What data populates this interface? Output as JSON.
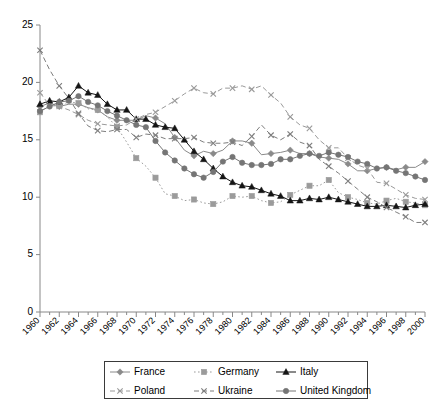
{
  "chart_data": {
    "type": "line",
    "title": "",
    "xlabel": "",
    "ylabel": "",
    "xlim": [
      1960,
      2000
    ],
    "ylim": [
      0,
      25
    ],
    "ytick_step": 5,
    "yticks": [
      0,
      5,
      10,
      15,
      20,
      25
    ],
    "xticks": [
      1960,
      1962,
      1964,
      1966,
      1968,
      1970,
      1972,
      1974,
      1976,
      1978,
      1980,
      1982,
      1984,
      1986,
      1988,
      1990,
      1992,
      1994,
      1996,
      1998,
      2000
    ],
    "xtick_minor_step": 1,
    "grid": false,
    "legend_position": "bottom",
    "x": [
      1960,
      1961,
      1962,
      1963,
      1964,
      1965,
      1966,
      1967,
      1968,
      1969,
      1970,
      1971,
      1972,
      1973,
      1974,
      1975,
      1976,
      1977,
      1978,
      1979,
      1980,
      1981,
      1982,
      1983,
      1984,
      1985,
      1986,
      1987,
      1988,
      1989,
      1990,
      1991,
      1992,
      1993,
      1994,
      1995,
      1996,
      1997,
      1998,
      1999,
      2000
    ],
    "series": [
      {
        "name": "France",
        "color": "#8a8a8a",
        "marker": "diamond",
        "dash": "solid",
        "values": [
          17.9,
          18.2,
          17.9,
          18.1,
          18.1,
          17.8,
          17.6,
          17.0,
          16.7,
          16.7,
          16.7,
          17.1,
          16.9,
          16.4,
          15.2,
          14.1,
          13.6,
          14.0,
          13.8,
          14.1,
          14.9,
          14.9,
          14.7,
          13.7,
          13.8,
          13.9,
          14.1,
          13.8,
          13.8,
          13.5,
          13.4,
          13.3,
          12.9,
          12.3,
          12.3,
          12.5,
          12.6,
          12.4,
          12.6,
          12.6,
          13.1
        ]
      },
      {
        "name": "Germany",
        "color": "#9b9b9b",
        "marker": "square",
        "dash": "dotted",
        "values": [
          17.4,
          18.0,
          18.0,
          18.3,
          18.2,
          17.7,
          17.6,
          17.0,
          16.1,
          14.8,
          13.4,
          12.7,
          11.7,
          10.3,
          10.1,
          9.7,
          9.8,
          9.5,
          9.4,
          9.6,
          10.1,
          10.0,
          10.1,
          9.7,
          9.5,
          9.6,
          10.2,
          10.6,
          11.0,
          11.0,
          11.5,
          10.4,
          10.0,
          9.8,
          9.5,
          9.4,
          9.7,
          9.9,
          9.6,
          9.5,
          9.3
        ]
      },
      {
        "name": "Italy",
        "color": "#151515",
        "marker": "triangle",
        "dash": "solid",
        "values": [
          18.1,
          18.4,
          18.3,
          18.7,
          19.7,
          19.1,
          18.9,
          18.1,
          17.6,
          17.6,
          16.8,
          16.8,
          16.3,
          16.1,
          16.0,
          15.0,
          14.0,
          13.3,
          12.5,
          11.8,
          11.3,
          11.0,
          10.9,
          10.6,
          10.3,
          10.1,
          9.7,
          9.7,
          9.9,
          9.8,
          10.0,
          9.8,
          9.6,
          9.4,
          9.2,
          9.2,
          9.3,
          9.2,
          9.1,
          9.3,
          9.4
        ]
      },
      {
        "name": "Poland",
        "color": "#9a9a9a",
        "marker": "x",
        "dash": "dashed",
        "values": [
          19.1,
          18.0,
          17.9,
          17.6,
          17.2,
          16.7,
          16.4,
          16.3,
          16.2,
          16.3,
          16.8,
          17.2,
          17.4,
          17.9,
          18.4,
          19.0,
          19.5,
          19.1,
          19.0,
          19.5,
          19.5,
          19.7,
          19.4,
          19.7,
          18.9,
          18.2,
          17.0,
          16.3,
          16.0,
          15.0,
          14.3,
          14.3,
          13.4,
          12.8,
          12.5,
          11.3,
          11.2,
          10.7,
          10.2,
          9.9,
          9.8
        ]
      },
      {
        "name": "Ukraine",
        "color": "#7d7d7d",
        "marker": "x",
        "dash": "dashed",
        "values": [
          22.8,
          21.1,
          19.7,
          18.6,
          17.3,
          16.2,
          15.8,
          15.7,
          15.9,
          15.9,
          15.2,
          15.5,
          15.4,
          15.1,
          15.1,
          15.1,
          15.2,
          14.8,
          14.7,
          14.7,
          14.8,
          14.5,
          15.3,
          16.3,
          15.4,
          15.0,
          15.5,
          14.8,
          14.5,
          13.3,
          12.7,
          12.1,
          11.4,
          10.7,
          10.0,
          9.6,
          9.1,
          8.7,
          8.3,
          7.8,
          7.8
        ]
      },
      {
        "name": "United Kingdom",
        "color": "#757575",
        "marker": "circle",
        "dash": "solid",
        "values": [
          17.5,
          17.9,
          18.3,
          18.4,
          18.8,
          18.3,
          18.0,
          17.5,
          17.1,
          16.7,
          16.3,
          16.1,
          14.9,
          13.9,
          13.2,
          12.5,
          12.0,
          11.7,
          12.2,
          13.1,
          13.5,
          13.0,
          12.8,
          12.8,
          12.9,
          13.3,
          13.3,
          13.6,
          13.8,
          13.6,
          13.9,
          13.7,
          13.5,
          13.1,
          12.9,
          12.5,
          12.6,
          12.3,
          12.1,
          11.8,
          11.5
        ]
      }
    ]
  },
  "legend": {
    "entries": [
      {
        "label": "France"
      },
      {
        "label": "Germany"
      },
      {
        "label": "Italy"
      },
      {
        "label": "Poland"
      },
      {
        "label": "Ukraine"
      },
      {
        "label": "United Kingdom"
      }
    ]
  }
}
